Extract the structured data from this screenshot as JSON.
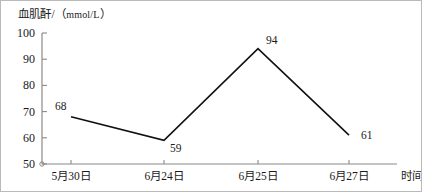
{
  "chart_data": {
    "type": "line",
    "title": "",
    "ylabel": "血肌酐/（mmol/L）",
    "ylabel_main": "血肌酐/（",
    "ylabel_unit": "mmol/L",
    "ylabel_tail": "）",
    "xlabel": "时间",
    "categories": [
      "5月30日",
      "6月24日",
      "6月25日",
      "6月27日"
    ],
    "values": [
      68,
      59,
      94,
      61
    ],
    "point_labels": [
      "68",
      "59",
      "94",
      "61"
    ],
    "ylim": [
      50,
      100
    ],
    "yticks": [
      100,
      90,
      80,
      70,
      60,
      50
    ],
    "ytick_labels": [
      "100",
      "90",
      "80",
      "70",
      "60",
      "50"
    ],
    "grid": false,
    "legend": false,
    "line_color": "#111111",
    "axis_color": "#8a8a8a"
  },
  "figure": {
    "border_color": "#b9b9b9",
    "background": "#ffffff"
  }
}
